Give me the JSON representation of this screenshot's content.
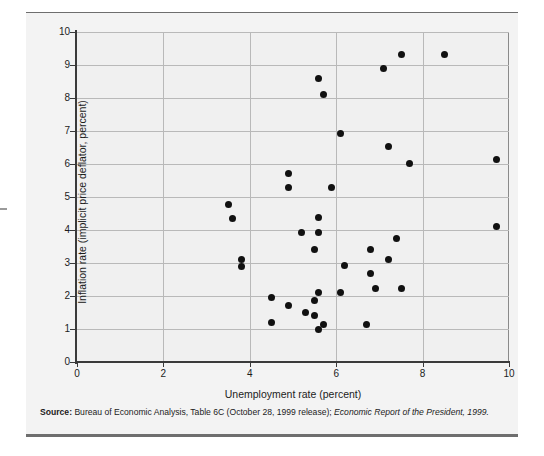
{
  "figure": {
    "background_color": "#f3f3f3",
    "rule_color": "#6e6e6e",
    "marker_color": "#111111",
    "grid_color": "#b9b9b9",
    "axis_color": "#3a3a3a"
  },
  "source": {
    "label": "Source:",
    "text_plain": " Bureau of Economic Analysis, Table 6C (October 28, 1999 release); ",
    "text_italic": "Economic Report of the President, 1999."
  },
  "chart_data": {
    "type": "scatter",
    "title": "",
    "xlabel": "Unemployment rate (percent)",
    "ylabel": "Inflation rate (implicit price deflator, percent)",
    "xlim": [
      0,
      10
    ],
    "ylim": [
      0,
      10
    ],
    "xticks": [
      0,
      2,
      4,
      6,
      8,
      10
    ],
    "yticks": [
      0,
      1,
      2,
      3,
      4,
      5,
      6,
      7,
      8,
      9,
      10
    ],
    "xticklabels": [
      "0",
      "2",
      "4",
      "6",
      "8",
      "10"
    ],
    "yticklabels": [
      "0",
      "1",
      "2",
      "3",
      "4",
      "5",
      "6",
      "7",
      "8",
      "9",
      "10"
    ],
    "grid": true,
    "grid_axis": "both",
    "legend": false,
    "series": [
      {
        "name": "Unemployment vs. inflation",
        "marker": "circle",
        "color": "#111111",
        "points": [
          [
            3.5,
            4.78
          ],
          [
            3.6,
            4.35
          ],
          [
            3.8,
            3.12
          ],
          [
            3.8,
            2.9
          ],
          [
            4.5,
            1.95
          ],
          [
            4.5,
            1.2
          ],
          [
            4.9,
            5.7
          ],
          [
            4.9,
            5.3
          ],
          [
            4.9,
            1.7
          ],
          [
            5.2,
            3.92
          ],
          [
            5.3,
            1.5
          ],
          [
            5.5,
            3.42
          ],
          [
            5.5,
            1.85
          ],
          [
            5.5,
            1.4
          ],
          [
            5.6,
            8.6
          ],
          [
            5.6,
            4.38
          ],
          [
            5.6,
            3.93
          ],
          [
            5.6,
            2.12
          ],
          [
            5.6,
            0.98
          ],
          [
            5.7,
            8.12
          ],
          [
            5.7,
            1.15
          ],
          [
            5.9,
            5.28
          ],
          [
            6.1,
            6.92
          ],
          [
            6.1,
            2.12
          ],
          [
            6.2,
            2.93
          ],
          [
            6.7,
            1.15
          ],
          [
            6.8,
            3.42
          ],
          [
            6.8,
            2.68
          ],
          [
            6.9,
            2.22
          ],
          [
            7.1,
            8.9
          ],
          [
            7.2,
            6.52
          ],
          [
            7.2,
            3.1
          ],
          [
            7.4,
            3.75
          ],
          [
            7.5,
            9.32
          ],
          [
            7.5,
            2.22
          ],
          [
            7.7,
            6.03
          ],
          [
            8.5,
            9.32
          ],
          [
            9.7,
            6.15
          ],
          [
            9.7,
            4.12
          ]
        ]
      }
    ]
  }
}
